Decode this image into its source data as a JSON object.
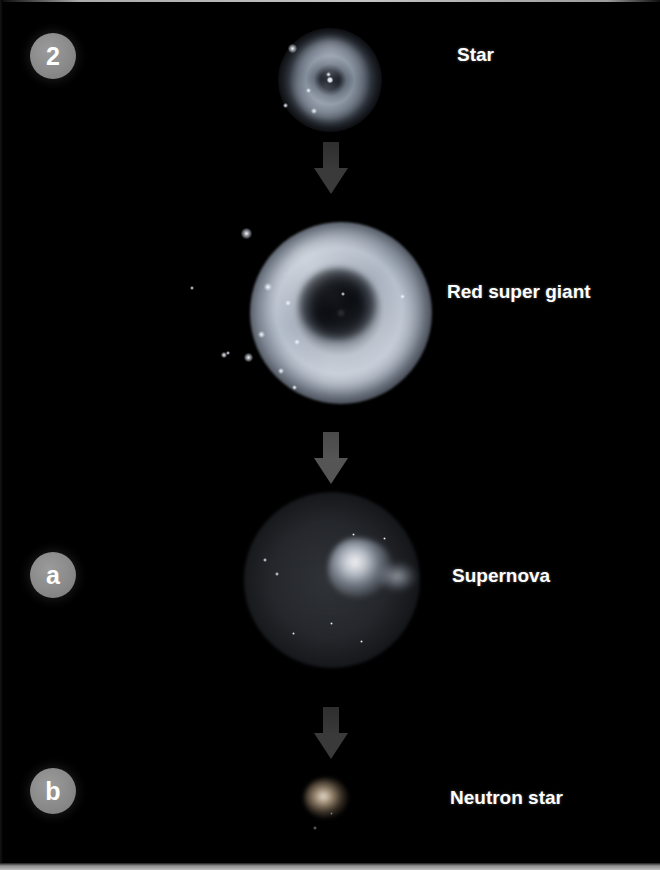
{
  "figure": {
    "background_color": "#000000",
    "label_color": "#ffffff",
    "badge_color": "#8a8a8a",
    "arrow_color": "#555555"
  },
  "badges": [
    {
      "id": "badge-2",
      "label": "2"
    },
    {
      "id": "badge-a",
      "label": "a"
    },
    {
      "id": "badge-b",
      "label": "b"
    }
  ],
  "stages": [
    {
      "id": "stage-star",
      "label": "Star",
      "object": "star-image"
    },
    {
      "id": "stage-red-giant",
      "label": "Red super giant",
      "object": "red-super-giant-image"
    },
    {
      "id": "stage-supernova",
      "label": "Supernova",
      "object": "supernova-image"
    },
    {
      "id": "stage-neutron",
      "label": "Neutron star",
      "object": "neutron-star-image"
    }
  ],
  "arrows": [
    {
      "id": "arrow-1",
      "direction": "down",
      "from": "Star",
      "to": "Red super giant"
    },
    {
      "id": "arrow-2",
      "direction": "down",
      "from": "Red super giant",
      "to": "Supernova"
    },
    {
      "id": "arrow-3",
      "direction": "down",
      "from": "Supernova",
      "to": "Neutron star"
    }
  ]
}
